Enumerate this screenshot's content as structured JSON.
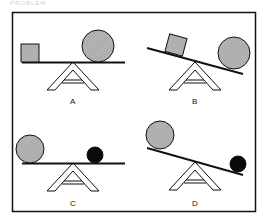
{
  "caption": "PROBLEM",
  "panels": [
    {
      "id": "A",
      "label": "A",
      "left_object": "gray square (small)",
      "right_object": "gray circle (large)",
      "plank": "level"
    },
    {
      "id": "B",
      "label": "B",
      "left_object": "gray square (small)",
      "right_object": "gray circle (large)",
      "plank": "tilted down to right"
    },
    {
      "id": "C",
      "label": "C",
      "left_object": "gray circle (large)",
      "right_object": "black ball (small)",
      "plank": "level"
    },
    {
      "id": "D",
      "label": "D",
      "left_object": "gray circle (large)",
      "right_object": "black ball (small)",
      "plank": "tilted down to right"
    }
  ],
  "colors": {
    "stroke": "#111111",
    "fill_gray": "#a8a8a8",
    "fill_black": "#0a0a0a",
    "background": "#ffffff"
  }
}
